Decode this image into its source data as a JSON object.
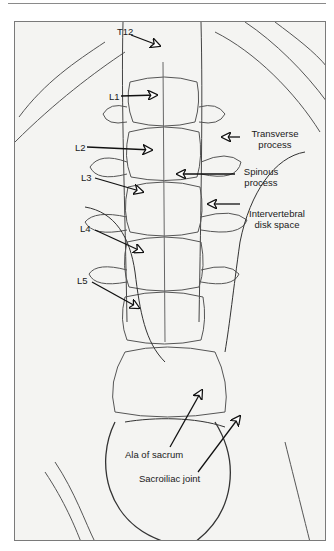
{
  "figure": {
    "labels": {
      "t12": "T12",
      "l1": "L1",
      "l2": "L2",
      "l3": "L3",
      "l4": "L4",
      "l5": "L5",
      "transverse_1": "Transverse",
      "transverse_2": "process",
      "spinous_1": "Spinous",
      "spinous_2": "process",
      "disk_1": "Intervertebral",
      "disk_2": "disk space",
      "ala": "Ala of sacrum",
      "si_joint": "Sacroiliac joint"
    },
    "colors": {
      "background": "#f4f4f2",
      "line": "#2a2a2a",
      "frame": "#7a7a7a"
    }
  }
}
